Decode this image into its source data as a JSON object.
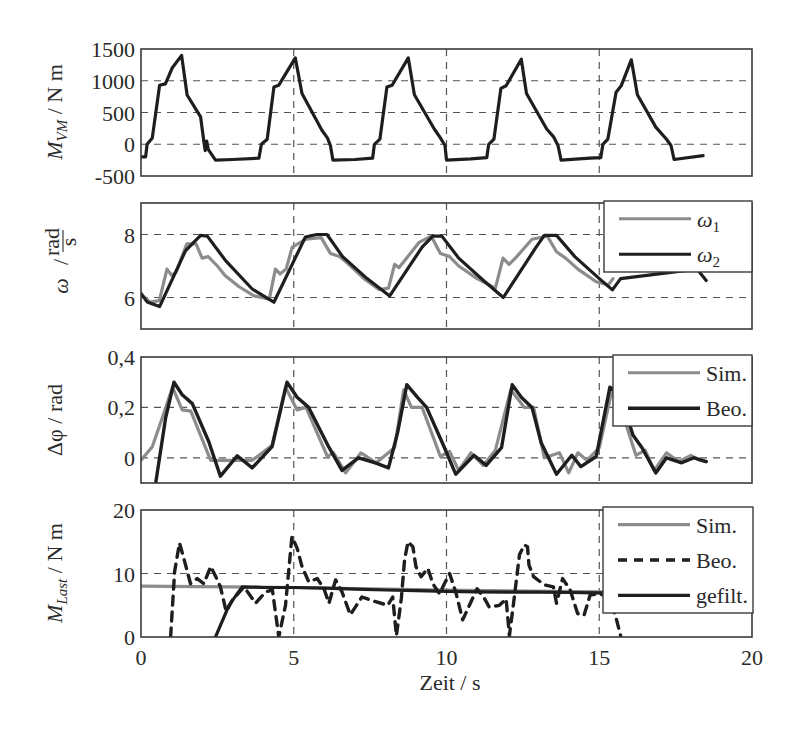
{
  "chart_data": [
    {
      "type": "line",
      "id": "mvm",
      "title": "",
      "ylabel": "M_VM / N m",
      "ylabel_parts": {
        "main": "M",
        "sub": "VM",
        "unit": " / N m"
      },
      "xlabel": "",
      "xlim": [
        0,
        20
      ],
      "ylim": [
        -500,
        1500
      ],
      "yticks": [
        -500,
        0,
        500,
        1000,
        1500
      ],
      "ytick_labels": [
        "-500",
        "0",
        "500",
        "1000",
        "1500"
      ],
      "ygrid": [
        0,
        500,
        1000
      ],
      "xgrid": [
        5,
        10,
        15
      ],
      "legend": null,
      "series": [
        {
          "name": "M_VM",
          "color": "#1e1e1e",
          "width": 3.2,
          "dash": null,
          "x": [
            0,
            0.15,
            0.2,
            0.37,
            0.61,
            0.8,
            1.02,
            1.33,
            1.51,
            1.95,
            2.06,
            2.1,
            2.15,
            2.2,
            2.44,
            3.0,
            3.86,
            3.94,
            4.13,
            4.35,
            4.51,
            5.05,
            5.27,
            5.92,
            6.1,
            6.2,
            6.28,
            7.0,
            7.58,
            7.64,
            7.82,
            8.05,
            8.22,
            8.75,
            8.95,
            9.6,
            9.8,
            9.95,
            10.0,
            10.8,
            11.32,
            11.38,
            11.55,
            11.78,
            11.95,
            12.45,
            12.62,
            13.28,
            13.5,
            13.65,
            13.75,
            14.7,
            15.05,
            15.12,
            15.28,
            15.55,
            15.72,
            16.05,
            16.25,
            16.85,
            17.2,
            17.35,
            17.45,
            18.4
          ],
          "y": [
            -200,
            -200,
            0,
            100,
            930,
            950,
            1200,
            1400,
            775,
            430,
            40,
            -100,
            50,
            -80,
            -250,
            -240,
            -220,
            0,
            80,
            900,
            930,
            1360,
            800,
            220,
            100,
            -20,
            -250,
            -240,
            -220,
            0,
            80,
            900,
            930,
            1360,
            780,
            240,
            100,
            -20,
            -250,
            -230,
            -210,
            0,
            80,
            880,
            920,
            1340,
            800,
            240,
            120,
            -20,
            -250,
            -220,
            -210,
            0,
            80,
            820,
            920,
            1330,
            780,
            270,
            80,
            -20,
            -240,
            -180
          ]
        }
      ]
    },
    {
      "type": "line",
      "id": "omega",
      "ylabel": "ω / (rad/s)",
      "ylabel_parts": {
        "main": "ω",
        "frac_num": "rad",
        "frac_den": "s"
      },
      "xlabel": "",
      "xlim": [
        0,
        20
      ],
      "ylim": [
        5,
        9
      ],
      "yticks": [
        6,
        8
      ],
      "ytick_labels": [
        "6",
        "8"
      ],
      "ygrid": [
        6,
        8
      ],
      "xgrid": [
        5,
        10,
        15
      ],
      "legend": {
        "position": "upper right",
        "entries": [
          "ω1",
          "ω2"
        ]
      },
      "series": [
        {
          "name": "ω1",
          "color": "#8c8c8c",
          "width": 3.2,
          "dash": null,
          "x": [
            0,
            0.3,
            0.6,
            0.85,
            1.0,
            1.15,
            1.5,
            1.8,
            2.0,
            2.2,
            2.5,
            2.75,
            3.2,
            3.7,
            4.2,
            4.4,
            4.55,
            4.75,
            4.95,
            5.4,
            5.9,
            6.2,
            6.5,
            6.8,
            7.3,
            7.8,
            8.1,
            8.3,
            8.45,
            8.65,
            9.1,
            9.5,
            9.8,
            10.1,
            10.4,
            11.0,
            11.6,
            11.85,
            12.05,
            12.3,
            12.8,
            13.3,
            13.6,
            13.9,
            14.3,
            14.9,
            15.3,
            15.45
          ],
          "y": [
            6.1,
            5.85,
            5.9,
            6.9,
            6.7,
            6.8,
            7.7,
            7.7,
            7.25,
            7.3,
            7.0,
            6.7,
            6.35,
            6.05,
            5.95,
            6.9,
            6.75,
            6.9,
            7.6,
            7.85,
            7.9,
            7.4,
            7.3,
            7.05,
            6.6,
            6.25,
            6.3,
            7.05,
            6.95,
            7.2,
            7.75,
            7.95,
            7.4,
            7.3,
            7.0,
            6.6,
            6.3,
            7.25,
            7.05,
            7.3,
            7.85,
            7.95,
            7.45,
            7.25,
            6.9,
            6.5,
            6.4,
            6.6
          ]
        },
        {
          "name": "ω2",
          "color": "#1e1e1e",
          "width": 3.2,
          "dash": null,
          "x": [
            0,
            0.2,
            0.61,
            1.46,
            1.95,
            2.17,
            2.77,
            3.64,
            4.35,
            5.38,
            5.75,
            6.09,
            6.6,
            7.4,
            8.14,
            9.2,
            9.55,
            9.85,
            10.4,
            11.2,
            11.86,
            12.9,
            13.2,
            13.6,
            14.2,
            15.0,
            15.43,
            15.7,
            18.2,
            18.5
          ],
          "y": [
            6.13,
            5.86,
            5.71,
            7.49,
            7.97,
            7.95,
            7.17,
            6.27,
            5.85,
            7.92,
            8.0,
            8.0,
            7.3,
            6.6,
            6.05,
            7.6,
            7.95,
            7.95,
            7.25,
            6.55,
            6.0,
            7.55,
            7.97,
            7.97,
            7.3,
            6.6,
            6.24,
            6.6,
            6.9,
            6.54
          ]
        }
      ]
    },
    {
      "type": "line",
      "id": "delta_phi",
      "ylabel": "Δφ / rad",
      "ylabel_parts": {
        "main": "Δφ / rad"
      },
      "xlabel": "",
      "xlim": [
        0,
        20
      ],
      "ylim": [
        -0.1,
        0.4
      ],
      "yticks": [
        0,
        0.2,
        0.4
      ],
      "ytick_labels": [
        "0",
        "0,2",
        "0,4"
      ],
      "ygrid": [
        0,
        0.2
      ],
      "xgrid": [
        5,
        10,
        15
      ],
      "legend": {
        "position": "upper right",
        "entries": [
          "Sim.",
          "Beo."
        ]
      },
      "series": [
        {
          "name": "Sim.",
          "color": "#8c8c8c",
          "width": 3.2,
          "dash": null,
          "x": [
            0,
            0.37,
            0.7,
            1.03,
            1.35,
            1.63,
            2.28,
            3.2,
            3.64,
            4.29,
            4.73,
            5.11,
            5.4,
            6.1,
            6.3,
            6.7,
            7.2,
            7.7,
            8.3,
            8.6,
            8.85,
            9.2,
            9.8,
            10.1,
            10.4,
            10.8,
            11.2,
            11.6,
            12.1,
            12.55,
            12.85,
            13.2,
            13.7,
            14.0,
            14.3,
            14.6,
            15.0,
            15.4,
            15.7,
            16.2,
            16.5,
            16.8,
            17.2,
            17.6,
            18.0,
            18.3,
            18.5
          ],
          "y": [
            -0.01,
            0.044,
            0.16,
            0.28,
            0.19,
            0.185,
            -0.01,
            -0.01,
            -0.01,
            0.05,
            0.28,
            0.19,
            0.2,
            0.005,
            0.02,
            -0.06,
            0.02,
            -0.02,
            0.04,
            0.27,
            0.2,
            0.2,
            0.005,
            0.025,
            -0.05,
            0.02,
            -0.03,
            0.03,
            0.27,
            0.2,
            0.2,
            0.0,
            0.02,
            -0.06,
            0.02,
            -0.01,
            0.04,
            0.26,
            0.2,
            0.01,
            0.03,
            -0.05,
            0.02,
            -0.015,
            0.01,
            -0.01,
            -0.015
          ]
        },
        {
          "name": "Beo.",
          "color": "#1e1e1e",
          "width": 3.4,
          "dash": null,
          "x": [
            0.48,
            0.81,
            1.08,
            1.35,
            1.68,
            2.22,
            2.6,
            3.15,
            3.64,
            4.29,
            4.78,
            5.11,
            5.49,
            6.14,
            6.58,
            7.12,
            7.67,
            8.1,
            8.4,
            8.7,
            9.05,
            9.35,
            9.9,
            10.3,
            10.9,
            11.3,
            11.8,
            12.15,
            12.45,
            12.8,
            13.1,
            13.6,
            14.1,
            14.4,
            14.9,
            15.35,
            15.7,
            16.1,
            16.4,
            16.85,
            17.2,
            17.7,
            18.1,
            18.5
          ],
          "y": [
            -0.1,
            0.16,
            0.3,
            0.25,
            0.215,
            0.064,
            -0.073,
            0.008,
            -0.04,
            0.044,
            0.3,
            0.24,
            0.2,
            0.044,
            -0.05,
            0.0,
            -0.02,
            -0.04,
            0.1,
            0.29,
            0.24,
            0.2,
            0.05,
            -0.065,
            0.01,
            -0.03,
            0.04,
            0.29,
            0.24,
            0.2,
            0.06,
            -0.065,
            0.01,
            -0.035,
            0.005,
            0.28,
            0.25,
            0.09,
            0.04,
            -0.06,
            0.0,
            -0.02,
            0.0,
            -0.015
          ]
        }
      ]
    },
    {
      "type": "line",
      "id": "mlast",
      "ylabel": "M_Last / N m",
      "ylabel_parts": {
        "main": "M",
        "sub": "Last",
        "unit": " / N m"
      },
      "xlabel": "Zeit / s",
      "xlim": [
        0,
        20
      ],
      "ylim": [
        0,
        20
      ],
      "yticks": [
        0,
        10,
        20
      ],
      "ytick_labels": [
        "0",
        "10",
        "20"
      ],
      "xticks": [
        0,
        5,
        10,
        15,
        20
      ],
      "xtick_labels": [
        "0",
        "5",
        "10",
        "15",
        "20"
      ],
      "ygrid": [
        10
      ],
      "xgrid": [
        5,
        10,
        15
      ],
      "legend": {
        "position": "upper right",
        "entries": [
          "Sim.",
          "Beo.",
          "gefilt."
        ]
      },
      "series": [
        {
          "name": "Sim.",
          "color": "#8c8c8c",
          "width": 3.2,
          "dash": null,
          "x": [
            0,
            5,
            10,
            15,
            15.5
          ],
          "y": [
            8.0,
            7.8,
            7.4,
            7.1,
            7.05
          ]
        },
        {
          "name": "Beo.",
          "color": "#1e1e1e",
          "width": 3.4,
          "dash": "9 7",
          "x": [
            0.97,
            1.1,
            1.26,
            1.4,
            1.62,
            1.84,
            2.06,
            2.28,
            2.45,
            2.6,
            2.79,
            2.99,
            3.37,
            3.75,
            4.08,
            4.3,
            4.51,
            4.73,
            4.94,
            5.11,
            5.27,
            5.49,
            5.77,
            5.99,
            6.15,
            6.37,
            6.58,
            6.85,
            7.23,
            7.65,
            8.08,
            8.24,
            8.36,
            8.52,
            8.63,
            8.74,
            8.9,
            9.0,
            9.17,
            9.39,
            9.55,
            9.77,
            9.93,
            10.1,
            10.3,
            10.53,
            10.75,
            11.0,
            11.25,
            11.4,
            11.73,
            11.95,
            12.06,
            12.2,
            12.39,
            12.55,
            12.65,
            12.7,
            12.85,
            13.2,
            13.5,
            13.6,
            13.8,
            14.05,
            14.29,
            14.5,
            14.7,
            14.95,
            15.3,
            15.55,
            15.7
          ],
          "y": [
            0,
            10.3,
            14.8,
            12.4,
            8.4,
            9.2,
            8.4,
            11.1,
            9.5,
            7.9,
            4.0,
            5.8,
            7.9,
            5.3,
            7.1,
            7.4,
            0,
            5.0,
            15.8,
            14.0,
            11.1,
            8.7,
            9.2,
            7.6,
            5.3,
            9.0,
            7.1,
            3.5,
            6.3,
            5.6,
            5.0,
            6.3,
            0.2,
            6.0,
            12.2,
            15.0,
            14.2,
            11.1,
            9.5,
            10.8,
            8.4,
            6.8,
            8.4,
            10.0,
            7.1,
            2.7,
            5.0,
            7.6,
            6.0,
            4.7,
            5.0,
            6.0,
            0.2,
            5.5,
            13.0,
            14.5,
            14.2,
            11.3,
            9.5,
            8.2,
            7.9,
            5.3,
            9.2,
            7.4,
            3.7,
            3.4,
            6.6,
            6.8,
            6.5,
            3.0,
            0.2
          ]
        },
        {
          "name": "gefilt.",
          "color": "#1e1e1e",
          "width": 3.2,
          "dash": null,
          "x": [
            2.44,
            2.88,
            3.31,
            4.0,
            5.0,
            6.0,
            7.0,
            8.0,
            9.0,
            10.0,
            11.0,
            12.0,
            13.0,
            14.0,
            15.0,
            15.3
          ],
          "y": [
            0,
            5.0,
            7.9,
            7.8,
            7.8,
            7.7,
            7.55,
            7.4,
            7.3,
            7.2,
            7.1,
            7.05,
            7.05,
            7.0,
            6.95,
            6.95
          ]
        }
      ]
    }
  ],
  "figure": {
    "xlabel": "Zeit / s",
    "panels": [
      "mvm",
      "omega",
      "delta_phi",
      "mlast"
    ]
  }
}
